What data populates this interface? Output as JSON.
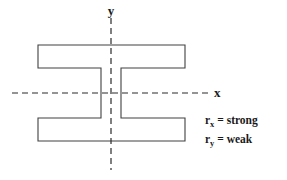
{
  "figure": {
    "background_color": "#ffffff",
    "outline_color": "#404040",
    "axis_color": "#2b2b2b",
    "text_color": "#1a1a1a"
  },
  "axes": {
    "x_label": "x",
    "y_label": "y",
    "x_axis_style": "dashed",
    "y_axis_style": "dashed",
    "x_axis_y_position": 93,
    "y_axis_x_position": 111,
    "x_axis_start": 12,
    "x_axis_end": 208,
    "y_axis_start": 18,
    "y_axis_end": 170
  },
  "shape": {
    "name": "wide-flange-i-beam",
    "flange_left": 38,
    "flange_right": 185,
    "top_flange_top": 45,
    "top_flange_bottom": 68,
    "bottom_flange_top": 118,
    "bottom_flange_bottom": 141,
    "web_left": 101,
    "web_right": 121
  },
  "notes": {
    "lines": [
      {
        "symbol": "r",
        "subscript": "x",
        "equals": "=",
        "value": "strong"
      },
      {
        "symbol": "r",
        "subscript": "y",
        "equals": "=",
        "value": "weak"
      }
    ],
    "line_1_full": "rₓ = strong",
    "line_2_full": "rᵧ = weak",
    "x_position": 205,
    "line_1_y": 124,
    "line_2_y": 143
  }
}
